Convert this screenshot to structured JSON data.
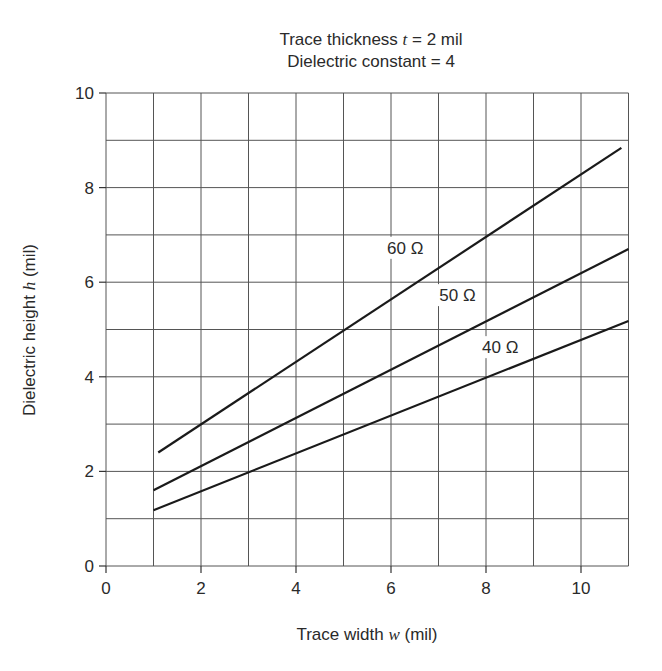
{
  "chart_data": {
    "type": "line",
    "title": "Trace thickness t = 2 mil",
    "subtitle": "Dielectric constant = 4",
    "title_parts": {
      "prefix": "Trace thickness ",
      "var": "t",
      "suffix": " = 2 mil"
    },
    "xlabel": "Trace width w (mil)",
    "xlabel_parts": {
      "prefix": "Trace width ",
      "var": "w",
      "suffix": " (mil)"
    },
    "ylabel": "Dielectric height h (mil)",
    "ylabel_parts": {
      "prefix": "Dielectric height ",
      "var": "h",
      "suffix": " (mil)"
    },
    "xlim": [
      0,
      11
    ],
    "ylim": [
      0,
      10
    ],
    "xticks": [
      0,
      2,
      4,
      6,
      8,
      10
    ],
    "yticks": [
      0,
      2,
      4,
      6,
      8,
      10
    ],
    "grid": true,
    "grid_step": 1,
    "legend": "inline labels",
    "series": [
      {
        "name": "60 Ω",
        "x": [
          1.1,
          10.85
        ],
        "y": [
          2.4,
          8.84
        ],
        "label_pos": [
          6.3,
          6.6
        ]
      },
      {
        "name": "50 Ω",
        "x": [
          1.0,
          11.0
        ],
        "y": [
          1.6,
          6.7
        ],
        "label_pos": [
          7.4,
          5.6
        ]
      },
      {
        "name": "40 Ω",
        "x": [
          1.0,
          11.0
        ],
        "y": [
          1.18,
          5.18
        ],
        "label_pos": [
          8.3,
          4.5
        ]
      }
    ]
  },
  "colors": {
    "line": "#1a1a1a",
    "grid": "#555555",
    "background": "#ffffff"
  }
}
